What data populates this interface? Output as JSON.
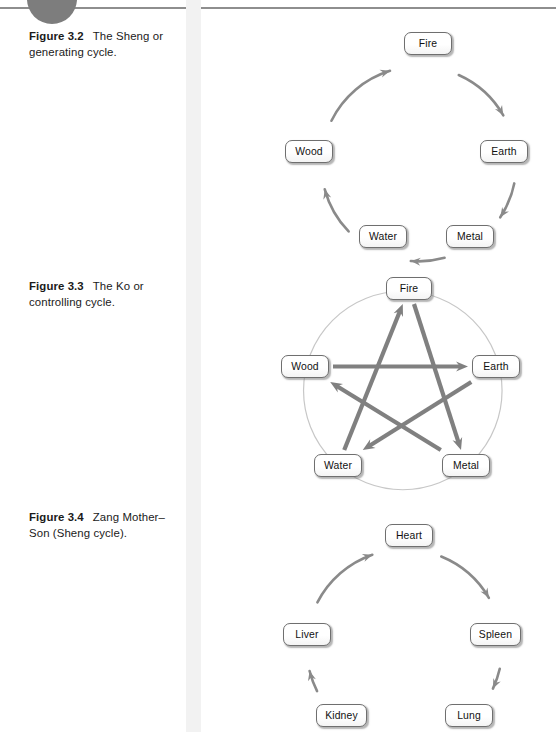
{
  "page": {
    "width": 556,
    "height": 732,
    "background": "#ffffff",
    "rule_color": "#8e8e8e",
    "tab_circle_color": "#7d7d7d",
    "column_band_color": "#f2f2f2"
  },
  "captions": {
    "fig32": {
      "number": "Figure 3.2",
      "text": "The Sheng or generating cycle."
    },
    "fig33": {
      "number": "Figure 3.3",
      "text": "The Ko or controlling cycle."
    },
    "fig34": {
      "number": "Figure 3.4",
      "text": "Zang Mother–Son (Sheng cycle)."
    }
  },
  "figures": [
    {
      "id": "sheng",
      "type": "cycle",
      "caption_ref": "fig32",
      "arrow_color": "#8a8a8a",
      "node_border": "#6f6f6f",
      "node_fill": "#fdfdfd",
      "direction": "clockwise",
      "nodes": [
        {
          "label": "Fire",
          "x": 146,
          "y": 14,
          "w": 48,
          "h": 23
        },
        {
          "label": "Earth",
          "x": 222,
          "y": 122,
          "w": 48,
          "h": 23
        },
        {
          "label": "Metal",
          "x": 188,
          "y": 207,
          "w": 48,
          "h": 23
        },
        {
          "label": "Water",
          "x": 101,
          "y": 207,
          "w": 48,
          "h": 23
        },
        {
          "label": "Wood",
          "x": 27,
          "y": 122,
          "w": 48,
          "h": 23
        }
      ],
      "edges": [
        {
          "from": "Wood",
          "to": "Fire"
        },
        {
          "from": "Fire",
          "to": "Earth"
        },
        {
          "from": "Earth",
          "to": "Metal"
        },
        {
          "from": "Metal",
          "to": "Water"
        },
        {
          "from": "Water",
          "to": "Wood"
        }
      ]
    },
    {
      "id": "ko",
      "type": "pentagram",
      "caption_ref": "fig33",
      "arrow_color": "#808080",
      "circle_color": "#c7c7c7",
      "node_border": "#6f6f6f",
      "node_fill": "#fdfdfd",
      "nodes": [
        {
          "label": "Fire",
          "x": 128,
          "y": 9,
          "w": 46,
          "h": 23
        },
        {
          "label": "Earth",
          "x": 214,
          "y": 87,
          "w": 48,
          "h": 23
        },
        {
          "label": "Metal",
          "x": 184,
          "y": 186,
          "w": 48,
          "h": 23
        },
        {
          "label": "Water",
          "x": 56,
          "y": 186,
          "w": 48,
          "h": 23
        },
        {
          "label": "Wood",
          "x": 23,
          "y": 87,
          "w": 48,
          "h": 23
        }
      ],
      "edges": [
        {
          "from": "Wood",
          "to": "Earth"
        },
        {
          "from": "Earth",
          "to": "Water"
        },
        {
          "from": "Water",
          "to": "Fire"
        },
        {
          "from": "Fire",
          "to": "Metal"
        },
        {
          "from": "Metal",
          "to": "Wood"
        }
      ]
    },
    {
      "id": "zang",
      "type": "cycle",
      "caption_ref": "fig34",
      "arrow_color": "#8a8a8a",
      "node_border": "#6f6f6f",
      "node_fill": "#fdfdfd",
      "direction": "clockwise",
      "nodes": [
        {
          "label": "Heart",
          "x": 127,
          "y": 21,
          "w": 48,
          "h": 23
        },
        {
          "label": "Spleen",
          "x": 212,
          "y": 120,
          "w": 51,
          "h": 23
        },
        {
          "label": "Lung",
          "x": 187,
          "y": 201,
          "w": 48,
          "h": 23
        },
        {
          "label": "Kidney",
          "x": 58,
          "y": 201,
          "w": 51,
          "h": 23
        },
        {
          "label": "Liver",
          "x": 25,
          "y": 120,
          "w": 48,
          "h": 23
        }
      ],
      "edges": [
        {
          "from": "Liver",
          "to": "Heart"
        },
        {
          "from": "Heart",
          "to": "Spleen"
        },
        {
          "from": "Spleen",
          "to": "Lung"
        },
        {
          "from": "Lung",
          "to": "Kidney"
        },
        {
          "from": "Kidney",
          "to": "Liver"
        }
      ]
    }
  ]
}
